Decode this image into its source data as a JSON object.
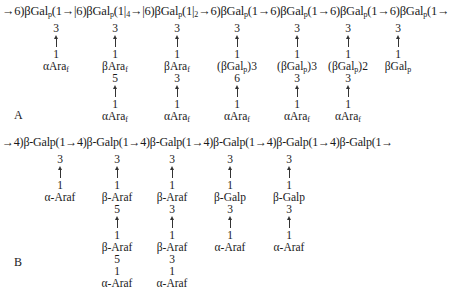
{
  "panel_a": {
    "label": "A",
    "backbone": "→6)βGal_p(1→|6)βGal_p(1|_4→|6)βGal_p(1|_2→6)βGal_p(1→6)βGal_p(1→6)βGal_p(1→6)βGal_p(1→",
    "backbone_parts": [
      "→6)βGal",
      "p",
      "(1→|6)βGal",
      "p",
      "(1|",
      "4",
      "→|6)βGal",
      "p",
      "(1|",
      "2",
      "→6)βGal",
      "p",
      "(1→6)βGal",
      "p",
      "(1→6)βGal",
      "p",
      "(1→6)βGal",
      "p",
      "(1→"
    ],
    "branches": [
      {
        "link1": "3",
        "link2": "1",
        "residue": "αAra",
        "sub": "f"
      },
      {
        "link1": "3",
        "link2": "1",
        "residue": "βAra",
        "sub": "f",
        "link3": "5",
        "link4": "1",
        "residue2": "αAra",
        "sub2": "f"
      },
      {
        "link1": "3",
        "link2": "1",
        "residue": "βAra",
        "sub": "f",
        "link3": "3",
        "link4": "1",
        "residue2": "αAra",
        "sub2": "f"
      },
      {
        "link1": "3",
        "link2": "1",
        "residue": "(βGal",
        "sub": "p",
        "rep": ")3",
        "link3": "6",
        "link4": "1",
        "residue2": "αAra",
        "sub2": "f"
      },
      {
        "link1": "3",
        "link2": "1",
        "residue": "(βGal",
        "sub": "p",
        "rep": ")3",
        "link3": "3",
        "link4": "1",
        "residue2": "αAra",
        "sub2": "f"
      },
      {
        "link1": "3",
        "link2": "1",
        "residue": "(βGal",
        "sub": "p",
        "rep": ")2",
        "link3": "3",
        "link4": "1",
        "residue2": "αAra",
        "sub2": "f"
      },
      {
        "link1": "3",
        "link2": "1",
        "residue": "βGal",
        "sub": "p"
      }
    ]
  },
  "panel_b": {
    "label": "B",
    "backbone": "→4)β-Galp(1→4)β-Galp(1→4)β-Galp(1→4)β-Galp(1→4)β-Galp(1→4)β-Galp(1→",
    "branches": [
      {
        "link1": "3",
        "link2": "1",
        "residue": "α-Araf"
      },
      {
        "link1": "3",
        "link2": "1",
        "residue": "β-Araf",
        "link3": "5",
        "link4": "1",
        "residue2": "β-Araf",
        "link5": "5",
        "link6": "1",
        "residue3": "α-Araf"
      },
      {
        "link1": "3",
        "link2": "1",
        "residue": "β-Araf",
        "link3": "3",
        "link4": "1",
        "residue2": "β-Araf",
        "link5": "3",
        "link6": "1",
        "residue3": "α-Araf"
      },
      {
        "link1": "3",
        "link2": "1",
        "residue": "β-Galp",
        "link3": "3",
        "link4": "1",
        "residue2": "α-Araf"
      },
      {
        "link1": "3",
        "link2": "1",
        "residue": "β-Galp",
        "link3": "3",
        "link4": "1",
        "residue2": "α-Araf"
      }
    ]
  }
}
